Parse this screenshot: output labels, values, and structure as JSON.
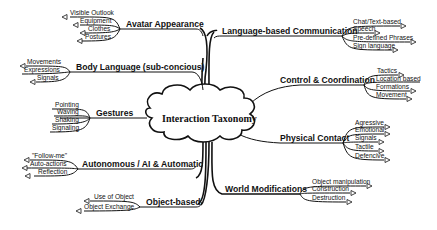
{
  "diagram": {
    "type": "mind-map",
    "center": {
      "label": "Interaction Taxonomy"
    },
    "branches": [
      {
        "id": "avatar",
        "label": "Avatar Appearance",
        "side": "left",
        "children": [
          "Visible Outlook",
          "Equipment",
          "Clothes",
          "Postures"
        ]
      },
      {
        "id": "body",
        "label": "Body Language (sub-concious)",
        "side": "left",
        "children": [
          "Movements",
          "Expressions",
          "Signals"
        ]
      },
      {
        "id": "gestures",
        "label": "Gestures",
        "side": "left",
        "children": [
          "Pointing",
          "Waving",
          "Shaking",
          "Signaling"
        ]
      },
      {
        "id": "autonomous",
        "label": "Autonomous / AI & Automatic",
        "side": "left",
        "children": [
          "\"Follow-me\"",
          "Auto-actions",
          "Reflection"
        ]
      },
      {
        "id": "object",
        "label": "Object-based",
        "side": "left",
        "children": [
          "Use of Object",
          "Object Exchange"
        ]
      },
      {
        "id": "language",
        "label": "Language-based Communication",
        "side": "right",
        "children": [
          "Chat/Text-based",
          "Speech",
          "Pre-defined Phrases",
          "Sign language"
        ]
      },
      {
        "id": "control",
        "label": "Control & Coordination",
        "side": "right",
        "children": [
          "Tactics",
          "Location based",
          "Formations",
          "Movement"
        ]
      },
      {
        "id": "physical",
        "label": "Physical Contact",
        "side": "right",
        "children": [
          "Agressive",
          "Emotional",
          "Signals",
          "Tactile",
          "Defencive"
        ]
      },
      {
        "id": "world",
        "label": "World Modifications",
        "side": "right",
        "children": [
          "Object manipulation",
          "Construction",
          "Destruction"
        ]
      }
    ]
  }
}
